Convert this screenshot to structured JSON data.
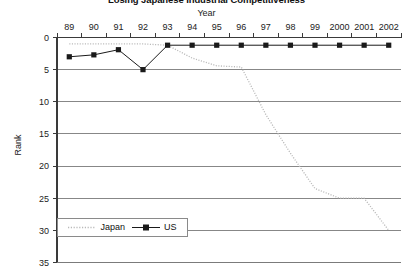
{
  "chart_data": {
    "type": "line",
    "title": "Losing Japanese Industrial Competitiveness",
    "xlabel": "Year",
    "ylabel": "Rank",
    "x": [
      89,
      90,
      91,
      92,
      93,
      94,
      95,
      96,
      97,
      98,
      99,
      2000,
      2001,
      2002
    ],
    "categories": [
      "89",
      "90",
      "91",
      "92",
      "93",
      "94",
      "95",
      "96",
      "97",
      "98",
      "99",
      "2000",
      "2001",
      "2002"
    ],
    "xlim": [
      88.5,
      2002.5
    ],
    "ylim": [
      0,
      35
    ],
    "y_inverted": true,
    "yticks": [
      0,
      5,
      10,
      15,
      20,
      25,
      30,
      35
    ],
    "ytick_labels": [
      "0",
      "5",
      "10",
      "15",
      "20",
      "25",
      "30",
      "35"
    ],
    "grid": "horizontal",
    "legend_position": "bottom-left",
    "series": [
      {
        "name": "Japan",
        "style": "dotted",
        "color": "#b9b9b9",
        "marker": "none",
        "values": [
          1,
          1,
          1,
          1,
          1.2,
          3.2,
          4.4,
          4.6,
          12,
          18,
          23.5,
          25,
          25,
          30
        ]
      },
      {
        "name": "US",
        "style": "solid",
        "color": "#1a1a1a",
        "marker": "square",
        "values": [
          3,
          2.7,
          1.9,
          5,
          1.2,
          1.2,
          1.2,
          1.2,
          1.2,
          1.2,
          1.2,
          1.2,
          1.2,
          1.2
        ]
      }
    ]
  },
  "legend": {
    "japan_label": "Japan",
    "us_label": "US"
  },
  "axes": {
    "x_title": "Year",
    "y_title": "Rank"
  },
  "colors": {
    "japan_line": "#b9b9b9",
    "us_line": "#1a1a1a",
    "grid": "#7a7a7a",
    "axis": "#3a3a3a",
    "background": "#ffffff"
  }
}
